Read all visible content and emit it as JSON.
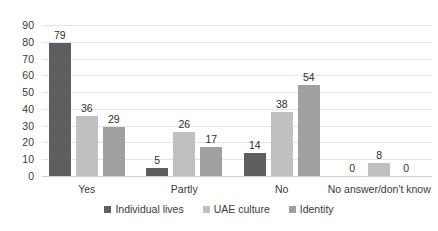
{
  "chart_data": {
    "type": "bar",
    "title": "",
    "subtitle": "",
    "xlabel": "",
    "ylabel": "",
    "ylim": [
      0,
      90
    ],
    "ytick_step": 10,
    "yticks": [
      "90",
      "80",
      "70",
      "60",
      "50",
      "40",
      "30",
      "20",
      "10",
      "0"
    ],
    "grid": true,
    "grid_axis": "y",
    "legend_position": "bottom",
    "categories": [
      "Yes",
      "Partly",
      "No",
      "No answer/don't know"
    ],
    "series": [
      {
        "name": "Individual lives",
        "color": "#5e5e5e",
        "values": [
          79,
          5,
          14,
          0
        ],
        "labels": [
          "79",
          "5",
          "14",
          "0"
        ]
      },
      {
        "name": "UAE culture",
        "color": "#c0c0c0",
        "values": [
          36,
          26,
          38,
          8
        ],
        "labels": [
          "36",
          "26",
          "38",
          "8"
        ]
      },
      {
        "name": "Identity",
        "color": "#a0a0a0",
        "values": [
          29,
          17,
          54,
          0
        ],
        "labels": [
          "29",
          "17",
          "54",
          "0"
        ]
      }
    ]
  },
  "colors": {
    "background": "#ffffff",
    "gridline": "#e4e4e4",
    "baseline": "#d0d0d0",
    "text": "#3a3a3a",
    "series_1": "#5e5e5e",
    "series_2": "#c0c0c0",
    "series_3": "#a0a0a0"
  }
}
